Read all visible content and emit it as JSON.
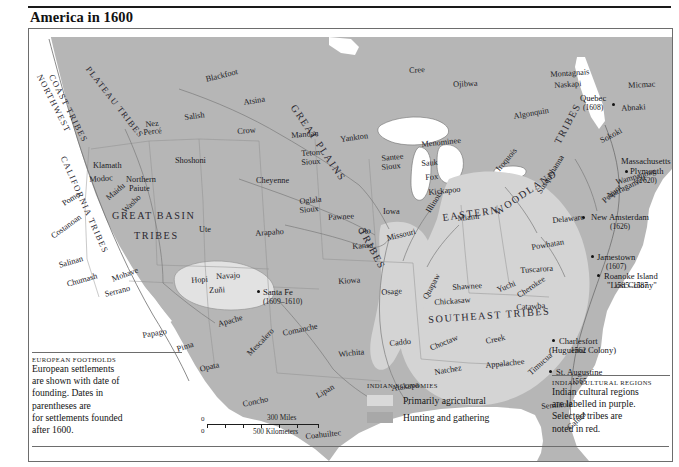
{
  "header": {
    "title": "America in 1600"
  },
  "map": {
    "cultural_regions": [
      {
        "label": "NORTHWEST COAST TRIBES",
        "id": "northwest-coast-tribes"
      },
      {
        "label": "PLATEAU TRIBES",
        "id": "plateau-tribes"
      },
      {
        "label": "CALIFORNIA TRIBES",
        "id": "california-tribes"
      },
      {
        "label": "GREAT BASIN TRIBES",
        "id": "great-basin-tribes"
      },
      {
        "label": "GREAT PLAINS TRIBES",
        "id": "great-plains-tribes"
      },
      {
        "label": "EASTERN WOODLAND TRIBES",
        "id": "eastern-woodland-tribes"
      },
      {
        "label": "SOUTHEAST TRIBES",
        "id": "southeast-tribes"
      }
    ],
    "region_lines": {
      "northwest_1": "NORTHWEST",
      "northwest_2": "COAST TRIBES",
      "plateau": "PLATEAU TRIBES",
      "california": "CALIFORNIA TRIBES",
      "great_basin_1": "GREAT BASIN",
      "great_basin_2": "TRIBES",
      "great_plains_1": "GREAT PLAINS",
      "great_plains_2": "TRIBES",
      "eastern_1": "EASTERN",
      "eastern_2": "WOODLAND",
      "eastern_3": "TRIBES",
      "southeast": "SOUTHEAST TRIBES"
    },
    "tribes": [
      "Blackfoot",
      "Atsina",
      "Salish",
      "Nez",
      "Percé",
      "Crow",
      "Mandan",
      "Yankton",
      "Shoshoni",
      "Teton",
      "Sioux",
      "Santee",
      "Sioux",
      "Cheyenne",
      "Oglala",
      "Sioux",
      "Pawnee",
      "Iowa",
      "Arapaho",
      "Oto",
      "Kansa",
      "Missouri",
      "Ute",
      "Klamath",
      "Modoc",
      "Northern",
      "Paiute",
      "Pomo",
      "Maidu",
      "Washo",
      "Costanoan",
      "Salinan",
      "Chumash",
      "Mohave",
      "Serrano",
      "Hopi",
      "Navajo",
      "Zuñi",
      "Pueblo",
      "Papago",
      "Pima",
      "Opata",
      "Apache",
      "Mescalero",
      "Concho",
      "Lipan",
      "Comanche",
      "Wichita",
      "Caddo",
      "Kiowa",
      "Osage",
      "Quapaw",
      "Chickasaw",
      "Choctaw",
      "Natchez",
      "Atakapa",
      "Coahuiltec",
      "Creek",
      "Appalachee",
      "Timucua",
      "Calusa",
      "Seminole",
      "Yuchi",
      "Cherokee",
      "Catawba",
      "Tuscarora",
      "Powhatan",
      "Shawnee",
      "Miami",
      "Illinois",
      "Kickapoo",
      "Fox",
      "Sauk",
      "Menominee",
      "Ojibwa",
      "Cree",
      "Algonquin",
      "Montagnais",
      "Naskapi",
      "Micmac",
      "Abnaki",
      "Sokoki",
      "Iroquois",
      "Susquehanna",
      "Delaware",
      "Massachusetts",
      "Wampanoag",
      "Narragansett",
      "Pequot",
      "Ogalala"
    ],
    "tribe_labels": [
      {
        "name": "Blackfoot",
        "x": 176,
        "y": 47,
        "rot": -14
      },
      {
        "name": "Atsina",
        "x": 214,
        "y": 70,
        "rot": -9
      },
      {
        "name": "Salish",
        "x": 155,
        "y": 85,
        "rot": -8
      },
      {
        "name": "Nez",
        "x": 116,
        "y": 92,
        "rot": -6
      },
      {
        "name": "Percé",
        "x": 114,
        "y": 100,
        "rot": -6
      },
      {
        "name": "Crow",
        "x": 208,
        "y": 99,
        "rot": -5
      },
      {
        "name": "Mandan",
        "x": 262,
        "y": 103,
        "rot": -5
      },
      {
        "name": "Yankton",
        "x": 311,
        "y": 107,
        "rot": -8
      },
      {
        "name": "Shoshoni",
        "x": 146,
        "y": 128,
        "rot": 0
      },
      {
        "name": "Klamath",
        "x": 64,
        "y": 133,
        "rot": 0
      },
      {
        "name": "Modoc",
        "x": 60,
        "y": 147,
        "rot": -4
      },
      {
        "name": "Northern",
        "x": 97,
        "y": 147,
        "rot": 0
      },
      {
        "name": "Paiute",
        "x": 100,
        "y": 156,
        "rot": 0
      },
      {
        "name": "Teton",
        "x": 272,
        "y": 121,
        "rot": -4
      },
      {
        "name": "Sioux",
        "x": 272,
        "y": 130,
        "rot": -4
      },
      {
        "name": "Santee",
        "x": 352,
        "y": 126,
        "rot": -6
      },
      {
        "name": "Sioux",
        "x": 352,
        "y": 135,
        "rot": -6
      },
      {
        "name": "Cheyenne",
        "x": 227,
        "y": 148,
        "rot": 0
      },
      {
        "name": "Pomo",
        "x": 32,
        "y": 172,
        "rot": -32
      },
      {
        "name": "Maidu",
        "x": 76,
        "y": 167,
        "rot": -40
      },
      {
        "name": "Washo",
        "x": 92,
        "y": 180,
        "rot": -44
      },
      {
        "name": "Oglala",
        "x": 270,
        "y": 169,
        "rot": -6
      },
      {
        "name": "Sioux",
        "x": 270,
        "y": 178,
        "rot": -6
      },
      {
        "name": "Pawnee",
        "x": 299,
        "y": 185,
        "rot": -3
      },
      {
        "name": "Iowa",
        "x": 354,
        "y": 179,
        "rot": 0
      },
      {
        "name": "Ute",
        "x": 170,
        "y": 197,
        "rot": 0
      },
      {
        "name": "Arapaho",
        "x": 226,
        "y": 201,
        "rot": -4
      },
      {
        "name": "Oto",
        "x": 329,
        "y": 199,
        "rot": -4
      },
      {
        "name": "Kansa",
        "x": 323,
        "y": 214,
        "rot": -4
      },
      {
        "name": "Missouri",
        "x": 357,
        "y": 206,
        "rot": -14
      },
      {
        "name": "Costanoan",
        "x": 21,
        "y": 205,
        "rot": -36
      },
      {
        "name": "Salinan",
        "x": 29,
        "y": 233,
        "rot": -16
      },
      {
        "name": "Chumash",
        "x": 37,
        "y": 252,
        "rot": -16
      },
      {
        "name": "Mohave",
        "x": 82,
        "y": 247,
        "rot": -20
      },
      {
        "name": "Serrano",
        "x": 75,
        "y": 262,
        "rot": -14
      },
      {
        "name": "Hopi",
        "x": 162,
        "y": 248,
        "rot": -4
      },
      {
        "name": "Navajo",
        "x": 187,
        "y": 244,
        "rot": -3
      },
      {
        "name": "Zuñi",
        "x": 180,
        "y": 258,
        "rot": -3
      },
      {
        "name": "Kiowa",
        "x": 309,
        "y": 249,
        "rot": -4
      },
      {
        "name": "Osage",
        "x": 352,
        "y": 260,
        "rot": -4
      },
      {
        "name": "Papago",
        "x": 113,
        "y": 303,
        "rot": -10
      },
      {
        "name": "Pima",
        "x": 147,
        "y": 317,
        "rot": -18
      },
      {
        "name": "Opata",
        "x": 170,
        "y": 337,
        "rot": -14
      },
      {
        "name": "Apache",
        "x": 188,
        "y": 292,
        "rot": -16
      },
      {
        "name": "Mescalero",
        "x": 217,
        "y": 323,
        "rot": -46
      },
      {
        "name": "Concho",
        "x": 213,
        "y": 372,
        "rot": -12
      },
      {
        "name": "Comanche",
        "x": 253,
        "y": 301,
        "rot": -12
      },
      {
        "name": "Lipan",
        "x": 286,
        "y": 364,
        "rot": -30
      },
      {
        "name": "Wichita",
        "x": 309,
        "y": 322,
        "rot": -6
      },
      {
        "name": "Caddo",
        "x": 360,
        "y": 311,
        "rot": -6
      },
      {
        "name": "Atakapa",
        "x": 362,
        "y": 356,
        "rot": -8
      },
      {
        "name": "Coahuiltec",
        "x": 276,
        "y": 404,
        "rot": -6
      },
      {
        "name": "Natchez",
        "x": 405,
        "y": 340,
        "rot": -10
      },
      {
        "name": "Choctaw",
        "x": 400,
        "y": 316,
        "rot": -22
      },
      {
        "name": "Chickasaw",
        "x": 405,
        "y": 270,
        "rot": -4
      },
      {
        "name": "Quapaw",
        "x": 393,
        "y": 268,
        "rot": -62
      },
      {
        "name": "Yuchi",
        "x": 467,
        "y": 258,
        "rot": -22
      },
      {
        "name": "Cherokee",
        "x": 487,
        "y": 264,
        "rot": -34
      },
      {
        "name": "Creek",
        "x": 456,
        "y": 309,
        "rot": -12
      },
      {
        "name": "Appalachee",
        "x": 456,
        "y": 333,
        "rot": -6
      },
      {
        "name": "Timucua",
        "x": 498,
        "y": 342,
        "rot": -42
      },
      {
        "name": "Seminole",
        "x": 512,
        "y": 374,
        "rot": -5
      },
      {
        "name": "Calusa",
        "x": 537,
        "y": 397,
        "rot": -44
      },
      {
        "name": "Catawba",
        "x": 487,
        "y": 275,
        "rot": -4
      },
      {
        "name": "Tuscarora",
        "x": 491,
        "y": 238,
        "rot": -4
      },
      {
        "name": "Powhatan",
        "x": 502,
        "y": 215,
        "rot": -10
      },
      {
        "name": "Shawnee",
        "x": 423,
        "y": 255,
        "rot": -4
      },
      {
        "name": "Miami",
        "x": 428,
        "y": 186,
        "rot": -6
      },
      {
        "name": "Illinois",
        "x": 396,
        "y": 181,
        "rot": -58
      },
      {
        "name": "Kickapoo",
        "x": 399,
        "y": 160,
        "rot": -6
      },
      {
        "name": "Fox",
        "x": 396,
        "y": 145,
        "rot": -4
      },
      {
        "name": "Sauk",
        "x": 392,
        "y": 131,
        "rot": -4
      },
      {
        "name": "Menominee",
        "x": 392,
        "y": 112,
        "rot": -6
      },
      {
        "name": "Ojibwa",
        "x": 424,
        "y": 52,
        "rot": -3
      },
      {
        "name": "Cree",
        "x": 380,
        "y": 38,
        "rot": -3
      },
      {
        "name": "Algonquin",
        "x": 484,
        "y": 84,
        "rot": -10
      },
      {
        "name": "Montagnais",
        "x": 521,
        "y": 42,
        "rot": -4
      },
      {
        "name": "Naskapi",
        "x": 525,
        "y": 53,
        "rot": -4
      },
      {
        "name": "Micmac",
        "x": 599,
        "y": 53,
        "rot": -3
      },
      {
        "name": "Abnaki",
        "x": 592,
        "y": 76,
        "rot": -4
      },
      {
        "name": "Sokoki",
        "x": 570,
        "y": 109,
        "rot": -28
      },
      {
        "name": "Iroquois",
        "x": 466,
        "y": 139,
        "rot": -50
      },
      {
        "name": "Susquehanna",
        "x": 507,
        "y": 162,
        "rot": -58
      },
      {
        "name": "Delaware",
        "x": 523,
        "y": 188,
        "rot": -6
      },
      {
        "name": "Pequot",
        "x": 572,
        "y": 170,
        "rot": -42
      },
      {
        "name": "Narragansett",
        "x": 577,
        "y": 164,
        "rot": -26
      },
      {
        "name": "Wampanoag",
        "x": 586,
        "y": 150,
        "rot": -16
      }
    ],
    "settlements": [
      {
        "name": "Quebec",
        "date": "(1608)",
        "x": 551,
        "y": 65,
        "dx": 583,
        "dy": 74
      },
      {
        "name": "Massachusetts",
        "date": "",
        "x": 592,
        "y": 128,
        "dx": null,
        "dy": null
      },
      {
        "name": "Plymouth",
        "date": "(1620)",
        "x": 601,
        "y": 138,
        "dx": 596,
        "dy": 141
      },
      {
        "name": "New Amsterdam",
        "date": "(1626)",
        "x": 562,
        "y": 184,
        "dx": 553,
        "dy": 187
      },
      {
        "name": "Jamestown",
        "date": "(1607)",
        "x": 568,
        "y": 224,
        "dx": 562,
        "dy": 226
      },
      {
        "name": "Roanoke Island",
        "date": "1585–1587",
        "x": 575,
        "y": 243,
        "dx": 568,
        "dy": 245
      },
      {
        "name": "Charlesfort",
        "date": "1562",
        "x": 530,
        "y": 308,
        "dx": 523,
        "dy": 310
      },
      {
        "name": "St. Augustine",
        "date": "1565",
        "x": 527,
        "y": 339,
        "dx": 520,
        "dy": 341
      },
      {
        "name": "Santa Fe",
        "date": "(1609–1610)",
        "x": 234,
        "y": 259,
        "dx": 228,
        "dy": 261
      }
    ],
    "settlement_sublabels": {
      "roanoke_quote": "\"Lost Colony\"",
      "charlesfort_sub": "(Huguenot Colony)"
    }
  },
  "legend_european": {
    "heading": "EUROPEAN FOOTHOLDS",
    "lines": [
      "European settlements",
      "are shown with date of",
      "founding. Dates in",
      "parentheses are",
      "for settlements founded",
      "after 1600."
    ]
  },
  "legend_economies": {
    "heading": "INDIAN ECONOMIES",
    "items": [
      {
        "label": "Primarily agricultural",
        "color": "#d9d9d9"
      },
      {
        "label": "Hunting and gathering",
        "color": "#a8a8a8"
      }
    ]
  },
  "legend_cultural": {
    "heading": "INDIAN CULTURAL REGIONS",
    "lines": [
      "Indian cultural regions",
      "are labelled in purple.",
      "Selected tribes are",
      "noted in red."
    ]
  },
  "scale": {
    "zero_top": "0",
    "zero_bottom": "0",
    "miles_label": "300 Miles",
    "km_label": "500 Kilometers"
  },
  "colors": {
    "land": "#b6b6b6",
    "agricultural": "#d9d9d9",
    "hunting": "#a8a8a8",
    "water": "#ffffff",
    "border": "#6d6d6d",
    "text": "#1b1b1b"
  }
}
